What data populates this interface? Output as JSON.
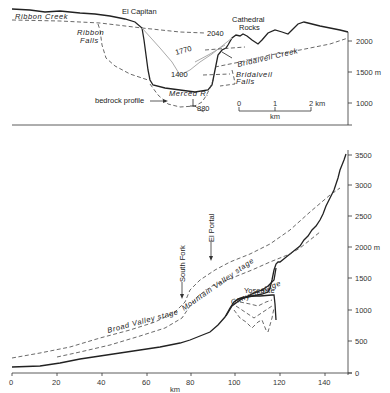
{
  "top_panel": {
    "description": "Cross-section of Yosemite Valley at El Capitan / Cathedral Rocks",
    "labels": {
      "el_capitan": "El Capitan",
      "cathedral_rocks_1": "Cathedral",
      "cathedral_rocks_2": "Rocks",
      "ribbon_creek": "Ribbon Creek",
      "ribbon_falls_1": "Ribbon",
      "ribbon_falls_2": "Falls",
      "bridalveil_creek": "Bridalveil Creek",
      "bridalveil_falls_1": "Bridalveil",
      "bridalveil_falls_2": "Falls",
      "merced_r": "Merced R.",
      "bedrock_profile": "bedrock profile",
      "elev_2040": "2040",
      "elev_1770": "1770",
      "elev_1400": "1400",
      "elev_880": "880"
    },
    "y_axis": {
      "ticks": [
        "2000",
        "1500 m",
        "1000"
      ]
    },
    "scale_bar": {
      "ticks": [
        "0",
        "1",
        "2 km"
      ],
      "unit": "km"
    }
  },
  "bottom_panel": {
    "description": "Longitudinal profile of Merced River with stages",
    "labels": {
      "broad_valley_stage": "Broad Valley stage",
      "mountain_valley_stage": "Mountain Valley stage",
      "canyon_stage": "Canyon stage",
      "yosemite": "Yosemite",
      "south_fork": "South Fork",
      "el_portal": "El Portal"
    },
    "x_axis": {
      "label": "km",
      "ticks": [
        "0",
        "20",
        "40",
        "60",
        "80",
        "100",
        "120",
        "140"
      ]
    },
    "y_axis": {
      "ticks": [
        "3500",
        "3000",
        "2500",
        "2000 m",
        "1500",
        "1000",
        "500",
        "0"
      ]
    }
  }
}
